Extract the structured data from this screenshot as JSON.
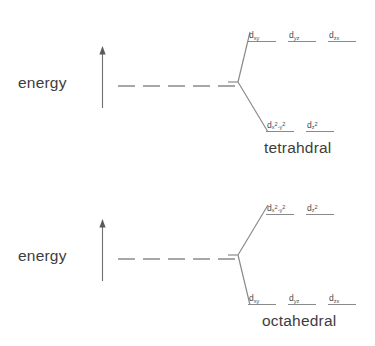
{
  "figure": {
    "type": "crystal-field-splitting-diagram",
    "background_color": "#ffffff",
    "line_color": "#8a8a8a",
    "text_color": "#3d3d3d"
  },
  "diagrams": [
    {
      "id": "tetrahedral",
      "axis_label": "energy",
      "axis_arrow_direction": "up",
      "caption": "tetrahdral",
      "upper_set": {
        "count": 3,
        "labels": [
          {
            "base": "d",
            "sub": "xy"
          },
          {
            "base": "d",
            "sub": "yz"
          },
          {
            "base": "d",
            "sub": "zx"
          }
        ]
      },
      "lower_set": {
        "count": 2,
        "labels": [
          {
            "base": "d",
            "sub": "x2-y2"
          },
          {
            "base": "d",
            "sub": "z2"
          }
        ]
      }
    },
    {
      "id": "octahedral",
      "axis_label": "energy",
      "axis_arrow_direction": "up",
      "caption": "octahedral",
      "upper_set": {
        "count": 2,
        "labels": [
          {
            "base": "d",
            "sub": "x2-y2"
          },
          {
            "base": "d",
            "sub": "z2"
          }
        ]
      },
      "lower_set": {
        "count": 3,
        "labels": [
          {
            "base": "d",
            "sub": "xy"
          },
          {
            "base": "d",
            "sub": "yz"
          },
          {
            "base": "d",
            "sub": "zx"
          }
        ]
      }
    }
  ]
}
